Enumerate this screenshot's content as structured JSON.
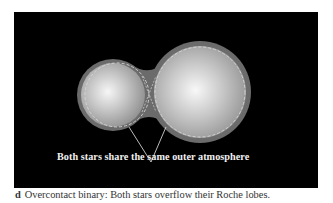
{
  "figure": {
    "panel_background": "#000000",
    "annotation": "Both stars share the same outer atmosphere",
    "caption": {
      "tag": "d",
      "text": "Overcontact binary: Both stars overflow their Roche lobes."
    },
    "elements": {
      "small_star": "small-star-with-roche-lobe",
      "large_star": "large-star-with-roche-lobe",
      "common_envelope": "shared-outer-atmosphere",
      "pointer": "v-shaped-pointer-lines"
    },
    "colors": {
      "envelope": "#6b6b6b",
      "star_highlight": "#f4f4f4",
      "star_shadow": "#8a8a8a",
      "roche_lobe_dash": "#d6d6d6",
      "pointer_line": "#e8e8e8",
      "caption_text": "#333333"
    }
  }
}
